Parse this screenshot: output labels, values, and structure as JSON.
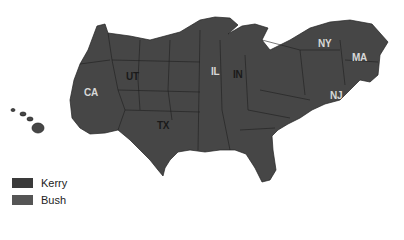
{
  "map": {
    "type": "election cartogram",
    "state_labels": [
      {
        "id": "CA",
        "text": "CA",
        "x": 84,
        "y": 87,
        "dark": false
      },
      {
        "id": "UT",
        "text": "UT",
        "x": 126,
        "y": 71,
        "dark": true
      },
      {
        "id": "TX",
        "text": "TX",
        "x": 157,
        "y": 120,
        "dark": true
      },
      {
        "id": "IL",
        "text": "IL",
        "x": 211,
        "y": 66,
        "dark": false
      },
      {
        "id": "IN",
        "text": "IN",
        "x": 233,
        "y": 69,
        "dark": true
      },
      {
        "id": "NY",
        "text": "NY",
        "x": 318,
        "y": 38,
        "dark": false
      },
      {
        "id": "MA",
        "text": "MA",
        "x": 352,
        "y": 52,
        "dark": false
      },
      {
        "id": "NJ",
        "text": "NJ",
        "x": 330,
        "y": 90,
        "dark": false
      }
    ]
  },
  "legend": {
    "items": [
      {
        "label": "Kerry",
        "color": "#3a3a3a"
      },
      {
        "label": "Bush",
        "color": "#555555"
      }
    ]
  },
  "colors": {
    "kerry": "#3a3a3a",
    "bush": "#4a4a4a",
    "border": "#1e1e1e"
  }
}
